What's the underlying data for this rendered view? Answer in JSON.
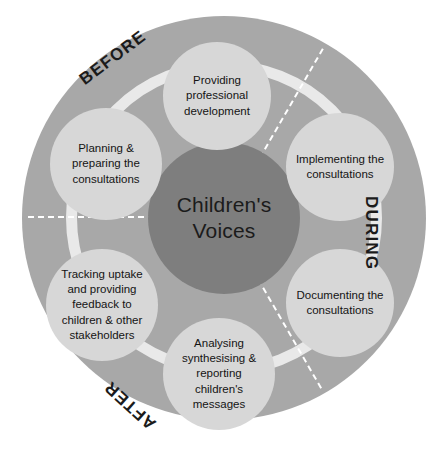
{
  "diagram": {
    "center": {
      "line1": "Children's",
      "line2": "Voices"
    },
    "phases": [
      {
        "id": "before",
        "label": "BEFORE"
      },
      {
        "id": "during",
        "label": "DURING"
      },
      {
        "id": "after",
        "label": "AFTER"
      }
    ],
    "nodes": [
      {
        "id": "providing-professional-development",
        "lines": [
          "Providing",
          "professional",
          "development"
        ]
      },
      {
        "id": "implementing-the-consultations",
        "lines": [
          "Implementing the",
          "consultations"
        ]
      },
      {
        "id": "documenting-the-consultations",
        "lines": [
          "Documenting the",
          "consultations"
        ]
      },
      {
        "id": "analysing-synthesising-reporting-childrens-messages",
        "lines": [
          "Analysing",
          "synthesising &",
          "reporting",
          "children's",
          "messages"
        ]
      },
      {
        "id": "tracking-uptake-feedback",
        "lines": [
          "Tracking uptake",
          "and providing",
          "feedback to",
          "children & other",
          "stakeholders"
        ]
      },
      {
        "id": "planning-preparing-the-consultations",
        "lines": [
          "Planning &",
          "preparing the",
          "consultations"
        ]
      }
    ],
    "caption_partial": "",
    "colors": {
      "page_background": "#ffffff",
      "outer_disc": "#a8a8a8",
      "ring_band": "#e9e9e9",
      "center_circle": "#7e7e7e",
      "node_circle": "#d7d7d7",
      "text": "#141414",
      "separator": "#ffffff"
    }
  }
}
